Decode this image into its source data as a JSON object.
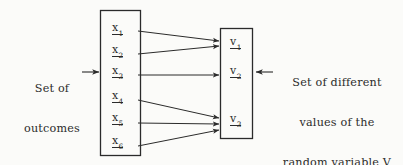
{
  "figure": {
    "type": "mapping-diagram",
    "background_color": "#fbfbf9",
    "ink_color": "#2b2b2b"
  },
  "left_caption": {
    "line1": "Set of",
    "line2": "outcomes",
    "arrow_icon": "→"
  },
  "right_caption": {
    "line1": "Set of different",
    "line2": "values of the",
    "line3_prefix": "random variable ",
    "line3_symbol": "V",
    "arrow_icon": "←"
  },
  "domain_box": {
    "name": "set of outcomes",
    "x": 100,
    "y": 10,
    "width": 40,
    "height": 145,
    "items": [
      {
        "symbol": "x",
        "subscript": "1",
        "cy": 30
      },
      {
        "symbol": "x",
        "subscript": "2",
        "cy": 52
      },
      {
        "symbol": "x",
        "subscript": "3",
        "cy": 73
      },
      {
        "symbol": "x",
        "subscript": "4",
        "cy": 98
      },
      {
        "symbol": "x",
        "subscript": "5",
        "cy": 120
      },
      {
        "symbol": "x",
        "subscript": "6",
        "cy": 143
      }
    ]
  },
  "range_box": {
    "name": "set of values",
    "x": 220,
    "y": 28,
    "width": 32,
    "height": 110,
    "items": [
      {
        "symbol": "v",
        "subscript": "1",
        "cy": 44
      },
      {
        "symbol": "v",
        "subscript": "2",
        "cy": 73
      },
      {
        "symbol": "v",
        "subscript": "3",
        "cy": 121
      }
    ]
  },
  "mappings": [
    {
      "from": "x1",
      "to": "v1",
      "x1": 138,
      "y1": 31,
      "x2": 219,
      "y2": 41
    },
    {
      "from": "x2",
      "to": "v1",
      "x1": 138,
      "y1": 54,
      "x2": 219,
      "y2": 46
    },
    {
      "from": "x3",
      "to": "v2",
      "x1": 138,
      "y1": 75,
      "x2": 219,
      "y2": 75
    },
    {
      "from": "x4",
      "to": "v3",
      "x1": 138,
      "y1": 100,
      "x2": 219,
      "y2": 118
    },
    {
      "from": "x5",
      "to": "v3",
      "x1": 138,
      "y1": 123,
      "x2": 219,
      "y2": 124
    },
    {
      "from": "x6",
      "to": "v3",
      "x1": 138,
      "y1": 146,
      "x2": 219,
      "y2": 130
    }
  ],
  "pointer_arrows": [
    {
      "name": "left-pointer",
      "direction": "right",
      "x": 82,
      "y": 72
    },
    {
      "name": "right-pointer",
      "direction": "left",
      "x": 256,
      "y": 72
    }
  ]
}
